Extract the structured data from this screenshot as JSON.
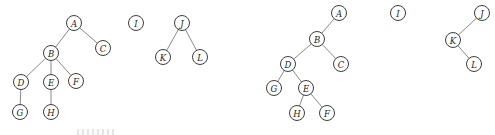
{
  "diagram": {
    "node_radius": 7.5,
    "colors": {
      "background": "#ffffff",
      "node_fill": "#ffffff",
      "node_stroke": "#3d3d3d",
      "edge": "#8a8a8a",
      "label": "#1c1c1c"
    },
    "groups": [
      {
        "name": "forest",
        "nodes": [
          {
            "id": "A",
            "label": "A",
            "x": 74,
            "y": 23
          },
          {
            "id": "B",
            "label": "B",
            "x": 51,
            "y": 53
          },
          {
            "id": "C",
            "label": "C",
            "x": 103,
            "y": 48
          },
          {
            "id": "D",
            "label": "D",
            "x": 21,
            "y": 82
          },
          {
            "id": "E",
            "label": "E",
            "x": 51,
            "y": 82
          },
          {
            "id": "F",
            "label": "F",
            "x": 76,
            "y": 81
          },
          {
            "id": "G",
            "label": "G",
            "x": 20,
            "y": 112
          },
          {
            "id": "H",
            "label": "H",
            "x": 51,
            "y": 112
          },
          {
            "id": "I",
            "label": "I",
            "x": 136,
            "y": 23
          },
          {
            "id": "J",
            "label": "J",
            "x": 182,
            "y": 23
          },
          {
            "id": "K",
            "label": "K",
            "x": 163,
            "y": 57
          },
          {
            "id": "L",
            "label": "L",
            "x": 200,
            "y": 57
          }
        ],
        "edges": [
          [
            "A",
            "B"
          ],
          [
            "A",
            "C"
          ],
          [
            "B",
            "D"
          ],
          [
            "B",
            "E"
          ],
          [
            "B",
            "F"
          ],
          [
            "D",
            "G"
          ],
          [
            "E",
            "H"
          ],
          [
            "J",
            "K"
          ],
          [
            "J",
            "L"
          ]
        ]
      },
      {
        "name": "binary-tree",
        "nodes": [
          {
            "id": "A",
            "label": "A",
            "x": 339,
            "y": 13
          },
          {
            "id": "B",
            "label": "B",
            "x": 317,
            "y": 39
          },
          {
            "id": "C",
            "label": "C",
            "x": 341,
            "y": 64
          },
          {
            "id": "D",
            "label": "D",
            "x": 288,
            "y": 64
          },
          {
            "id": "E",
            "label": "E",
            "x": 306,
            "y": 88
          },
          {
            "id": "F",
            "label": "F",
            "x": 327,
            "y": 113
          },
          {
            "id": "G",
            "label": "G",
            "x": 274,
            "y": 88
          },
          {
            "id": "H",
            "label": "H",
            "x": 297,
            "y": 113
          },
          {
            "id": "I",
            "label": "I",
            "x": 398,
            "y": 13
          },
          {
            "id": "J",
            "label": "J",
            "x": 482,
            "y": 13
          },
          {
            "id": "K",
            "label": "K",
            "x": 453,
            "y": 40
          },
          {
            "id": "L",
            "label": "L",
            "x": 474,
            "y": 64
          }
        ],
        "edges": [
          [
            "A",
            "B"
          ],
          [
            "B",
            "D"
          ],
          [
            "B",
            "C"
          ],
          [
            "D",
            "G"
          ],
          [
            "D",
            "E"
          ],
          [
            "E",
            "H"
          ],
          [
            "E",
            "F"
          ],
          [
            "J",
            "K"
          ],
          [
            "K",
            "L"
          ]
        ]
      }
    ]
  }
}
